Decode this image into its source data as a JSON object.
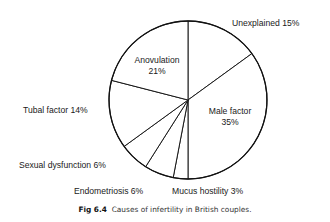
{
  "chart_data": {
    "type": "pie",
    "title": "Causes of infertility in British couples.",
    "figure_label": "Fig 6.4",
    "start_angle_deg": 0,
    "direction": "clockwise",
    "slices": [
      {
        "label": "Unexplained",
        "value": 15,
        "text": "Unexplained 15%",
        "label_pos": [
          232,
          26
        ],
        "anchor": "start",
        "outside": true
      },
      {
        "label": "Male factor",
        "value": 35,
        "text_lines": [
          "Male factor",
          "35%"
        ],
        "label_pos": [
          230,
          114
        ],
        "anchor": "middle",
        "outside": false
      },
      {
        "label": "Mucus hostility",
        "value": 3,
        "text": "Mucus hostility 3%",
        "label_pos": [
          172,
          194
        ],
        "anchor": "start",
        "outside": true
      },
      {
        "label": "Endometriosis",
        "value": 6,
        "text": "Endometriosis 6%",
        "label_pos": [
          74,
          194
        ],
        "anchor": "start",
        "outside": true
      },
      {
        "label": "Sexual dysfunction",
        "value": 6,
        "text": "Sexual dysfunction 6%",
        "label_pos": [
          19,
          168
        ],
        "anchor": "start",
        "outside": true
      },
      {
        "label": "Tubal factor",
        "value": 14,
        "text": "Tubal factor 14%",
        "label_pos": [
          23,
          113
        ],
        "anchor": "start",
        "outside": true
      },
      {
        "label": "Anovulation",
        "value": 21,
        "text_lines": [
          "Anovulation",
          "21%"
        ],
        "label_pos": [
          157,
          63
        ],
        "anchor": "middle",
        "outside": false
      }
    ],
    "center": [
      188,
      100
    ],
    "radius": 79
  },
  "caption": {
    "figure_label": "Fig 6.4",
    "text": "Causes of infertility in British couples."
  }
}
